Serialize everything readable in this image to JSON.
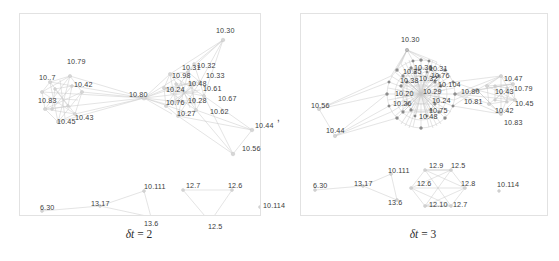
{
  "figure": {
    "separator": ",",
    "panels": [
      {
        "id": "left",
        "caption_symbol": "δt",
        "caption_value": "= 2",
        "caption_full": "δt = 2",
        "node_labels": [
          {
            "text": "10.79",
            "x": 47,
            "y": 44
          },
          {
            "text": "10..7",
            "x": 19,
            "y": 60
          },
          {
            "text": "10.42",
            "x": 54,
            "y": 67
          },
          {
            "text": "10.83",
            "x": 18,
            "y": 83
          },
          {
            "text": "10.45",
            "x": 37,
            "y": 104
          },
          {
            "text": "10.43",
            "x": 55,
            "y": 100
          },
          {
            "text": "10.80",
            "x": 109,
            "y": 77
          },
          {
            "text": "10.30",
            "x": 196,
            "y": 13
          },
          {
            "text": "10.31",
            "x": 162,
            "y": 50
          },
          {
            "text": "10.32",
            "x": 177,
            "y": 48
          },
          {
            "text": "10.33",
            "x": 186,
            "y": 58
          },
          {
            "text": "10.98",
            "x": 152,
            "y": 58
          },
          {
            "text": "10.48",
            "x": 168,
            "y": 66
          },
          {
            "text": "10.24",
            "x": 146,
            "y": 72
          },
          {
            "text": "10.61",
            "x": 183,
            "y": 71
          },
          {
            "text": "10.28",
            "x": 168,
            "y": 83
          },
          {
            "text": "10.76",
            "x": 146,
            "y": 85
          },
          {
            "text": "10.67",
            "x": 198,
            "y": 81
          },
          {
            "text": "10.27",
            "x": 157,
            "y": 96
          },
          {
            "text": "10.62",
            "x": 190,
            "y": 94
          },
          {
            "text": "10.44",
            "x": 235,
            "y": 108
          },
          {
            "text": "10.56",
            "x": 222,
            "y": 131
          },
          {
            "text": "6.30",
            "x": 20,
            "y": 190
          },
          {
            "text": "13.17",
            "x": 71,
            "y": 186
          },
          {
            "text": "10.111",
            "x": 124,
            "y": 169
          },
          {
            "text": "13.6",
            "x": 124,
            "y": 206
          },
          {
            "text": "12.7",
            "x": 166,
            "y": 168
          },
          {
            "text": "12.6",
            "x": 208,
            "y": 168
          },
          {
            "text": "12.5",
            "x": 188,
            "y": 209
          },
          {
            "text": "10.114",
            "x": 243,
            "y": 188
          }
        ]
      },
      {
        "id": "right",
        "caption_symbol": "δt",
        "caption_value": "= 3",
        "caption_full": "δt = 3",
        "node_labels": [
          {
            "text": "10.30",
            "x": 100,
            "y": 22
          },
          {
            "text": "10.36",
            "x": 113,
            "y": 50
          },
          {
            "text": "10.35",
            "x": 102,
            "y": 54
          },
          {
            "text": "10.31",
            "x": 128,
            "y": 51
          },
          {
            "text": "10.76",
            "x": 130,
            "y": 58
          },
          {
            "text": "10.32",
            "x": 118,
            "y": 61
          },
          {
            "text": "10.38",
            "x": 99,
            "y": 63
          },
          {
            "text": "10.104",
            "x": 137,
            "y": 67
          },
          {
            "text": "10.29",
            "x": 122,
            "y": 74
          },
          {
            "text": "10.20",
            "x": 94,
            "y": 76
          },
          {
            "text": "10.24",
            "x": 131,
            "y": 83
          },
          {
            "text": "10.26",
            "x": 92,
            "y": 86
          },
          {
            "text": "10.75",
            "x": 128,
            "y": 93
          },
          {
            "text": "10.48",
            "x": 118,
            "y": 99
          },
          {
            "text": "10.80",
            "x": 160,
            "y": 74
          },
          {
            "text": "10.81",
            "x": 163,
            "y": 84
          },
          {
            "text": "10.56",
            "x": 10,
            "y": 88
          },
          {
            "text": "10.44",
            "x": 25,
            "y": 113
          },
          {
            "text": "10.47",
            "x": 203,
            "y": 61
          },
          {
            "text": "10.43",
            "x": 194,
            "y": 74
          },
          {
            "text": "10.79",
            "x": 213,
            "y": 71
          },
          {
            "text": "10.45",
            "x": 214,
            "y": 86
          },
          {
            "text": "10.42",
            "x": 194,
            "y": 93
          },
          {
            "text": "10.83",
            "x": 203,
            "y": 105
          },
          {
            "text": "6.30",
            "x": 12,
            "y": 168
          },
          {
            "text": "13.17",
            "x": 53,
            "y": 166
          },
          {
            "text": "10.111",
            "x": 87,
            "y": 153
          },
          {
            "text": "13.6",
            "x": 87,
            "y": 185
          },
          {
            "text": "12.9",
            "x": 128,
            "y": 148
          },
          {
            "text": "12.5",
            "x": 150,
            "y": 148
          },
          {
            "text": "12.6",
            "x": 116,
            "y": 166
          },
          {
            "text": "12.8",
            "x": 160,
            "y": 166
          },
          {
            "text": "12.10",
            "x": 128,
            "y": 187
          },
          {
            "text": "12.7",
            "x": 152,
            "y": 187
          },
          {
            "text": "10.114",
            "x": 196,
            "y": 167
          }
        ]
      }
    ]
  }
}
